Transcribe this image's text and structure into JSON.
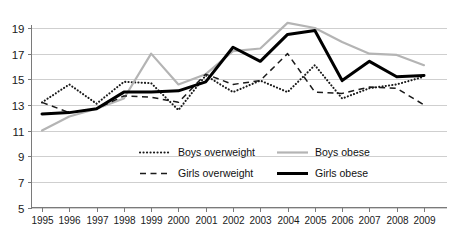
{
  "chart_data": {
    "type": "line",
    "title": "",
    "subtitle": "",
    "xlabel": "",
    "ylabel": "",
    "categories": [
      "1995",
      "1996",
      "1997",
      "1998",
      "1999",
      "2000",
      "2001",
      "2002",
      "2003",
      "2004",
      "2005",
      "2006",
      "2007",
      "2008",
      "2009"
    ],
    "x": [
      1995,
      1996,
      1997,
      1998,
      1999,
      2000,
      2001,
      2002,
      2003,
      2004,
      2005,
      2006,
      2007,
      2008,
      2009
    ],
    "xlim": [
      1995,
      2009
    ],
    "ylim": [
      5,
      19
    ],
    "y_ticks": [
      5,
      7,
      9,
      11,
      13,
      15,
      17,
      19
    ],
    "x_ticks": [
      "1995",
      "1996",
      "1997",
      "1998",
      "1999",
      "2000",
      "2001",
      "2002",
      "2003",
      "2004",
      "2005",
      "2006",
      "2007",
      "2008",
      "2009"
    ],
    "grid": true,
    "grid_axis": "y",
    "legend_position": "inside-bottom-center",
    "series": [
      {
        "name": "Boys overweight",
        "style": "dotted",
        "color": "#1a1a1a",
        "width": 2.1,
        "values": [
          13.2,
          14.6,
          13.1,
          14.8,
          14.7,
          12.6,
          15.3,
          14.0,
          14.9,
          14.0,
          16.1,
          13.5,
          14.3,
          14.6,
          15.2
        ]
      },
      {
        "name": "Boys obese",
        "style": "solid",
        "color": "#b4b4b4",
        "width": 2.2,
        "values": [
          11.0,
          12.1,
          12.7,
          13.5,
          17.0,
          14.6,
          15.4,
          17.2,
          17.4,
          19.4,
          19.0,
          17.9,
          17.0,
          16.9,
          16.1
        ]
      },
      {
        "name": "Girls overweight",
        "style": "dashed",
        "color": "#1a1a1a",
        "width": 1.5,
        "values": [
          13.2,
          12.4,
          12.7,
          13.7,
          13.6,
          13.2,
          15.4,
          14.6,
          14.9,
          17.0,
          14.0,
          13.9,
          14.4,
          14.3,
          13.0
        ]
      },
      {
        "name": "Girls obese",
        "style": "solid",
        "color": "#000000",
        "width": 3.0,
        "values": [
          12.3,
          12.4,
          12.7,
          14.0,
          14.0,
          14.1,
          14.8,
          17.5,
          16.4,
          18.5,
          18.8,
          14.9,
          16.4,
          15.2,
          15.3
        ]
      }
    ]
  },
  "legend": {
    "entries": [
      {
        "label": "Boys overweight",
        "swatch": "dotted-line-swatch"
      },
      {
        "label": "Boys obese",
        "swatch": "solid-gray-line-swatch"
      },
      {
        "label": "Girls overweight",
        "swatch": "dashed-line-swatch"
      },
      {
        "label": "Girls obese",
        "swatch": "solid-black-line-swatch"
      }
    ]
  },
  "colors": {
    "boys_obese": "#b4b4b4",
    "girls_obese": "#000000",
    "overweight_lines": "#1a1a1a",
    "gridline": "#cfcfcf",
    "axis": "#7a7a7a"
  }
}
